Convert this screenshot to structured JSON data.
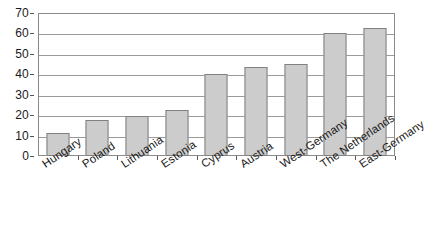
{
  "chart_data": {
    "type": "bar",
    "title": "",
    "subtitle": "",
    "xlabel": "",
    "ylabel": "",
    "categories": [
      "Hungary",
      "Poland",
      "Lithuania",
      "Estonia",
      "Cyprus",
      "Austria",
      "West-Germany",
      "The Netherlands",
      "East-Germany"
    ],
    "values": [
      11.3,
      17.6,
      19.6,
      22.5,
      40.0,
      43.5,
      45.0,
      60.3,
      62.5
    ],
    "ylim": [
      0,
      70
    ],
    "yticks": [
      0,
      10,
      20,
      30,
      40,
      50,
      60,
      70
    ],
    "ytick_labels": [
      "0",
      "10",
      "20",
      "30",
      "40",
      "50",
      "60",
      "70"
    ],
    "grid": "horizontal",
    "legend": "none",
    "series": [
      {
        "name": "",
        "values": [
          11.3,
          17.6,
          19.6,
          22.5,
          40.0,
          43.5,
          45.0,
          60.3,
          62.5
        ]
      }
    ],
    "colors": {
      "bar_fill": "#cccccc",
      "bar_border": "#808080",
      "gridline": "#9a9a9a",
      "frame": "#8a8a8a",
      "text": "#1a1a1a",
      "background": "#ffffff"
    }
  }
}
